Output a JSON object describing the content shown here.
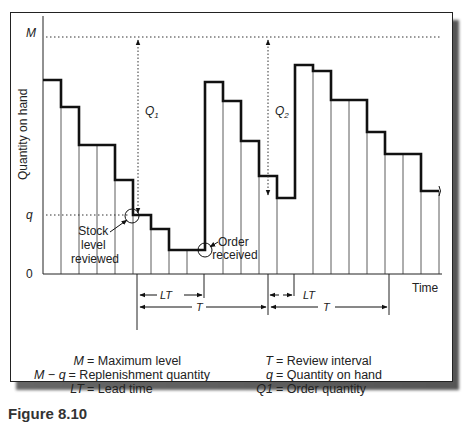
{
  "diagram": {
    "y_axis_label": "Quantity on hand",
    "x_axis_label": "Time",
    "y_ticks": {
      "max": "M",
      "reorder": "q",
      "zero": "0"
    },
    "order_labels": [
      "Q1",
      "Q2"
    ],
    "annotations": {
      "stock_reviewed": [
        "Stock",
        "level",
        "reviewed"
      ],
      "order_received": [
        "Order",
        "received"
      ]
    },
    "intervals": {
      "lead_time": "LT",
      "review_interval": "T"
    },
    "steps": [
      {
        "x0": 43,
        "x1": 61,
        "y": 80
      },
      {
        "x0": 61,
        "x1": 79,
        "y": 107
      },
      {
        "x0": 79,
        "x1": 115,
        "y": 145
      },
      {
        "x0": 115,
        "x1": 133,
        "y": 180
      },
      {
        "x0": 133,
        "x1": 151,
        "y": 215
      },
      {
        "x0": 151,
        "x1": 169,
        "y": 229
      },
      {
        "x0": 169,
        "x1": 205,
        "y": 250
      },
      {
        "x0": 205,
        "x1": 223,
        "y": 82
      },
      {
        "x0": 223,
        "x1": 241,
        "y": 101
      },
      {
        "x0": 241,
        "x1": 259,
        "y": 141
      },
      {
        "x0": 259,
        "x1": 277,
        "y": 176
      },
      {
        "x0": 277,
        "x1": 295,
        "y": 198
      },
      {
        "x0": 295,
        "x1": 313,
        "y": 65
      },
      {
        "x0": 313,
        "x1": 331,
        "y": 71
      },
      {
        "x0": 331,
        "x1": 367,
        "y": 100
      },
      {
        "x0": 367,
        "x1": 385,
        "y": 132
      },
      {
        "x0": 385,
        "x1": 421,
        "y": 154
      },
      {
        "x0": 421,
        "x1": 439,
        "y": 191
      }
    ]
  },
  "legend": {
    "left": [
      {
        "symbol": "M",
        "text": "= Maximum level"
      },
      {
        "symbol": "M − q",
        "text": "= Replenishment quantity"
      },
      {
        "symbol": "LT",
        "text": "= Lead time"
      }
    ],
    "right": [
      {
        "symbol": "T",
        "text": "= Review interval"
      },
      {
        "symbol": "q",
        "text": "= Quantity on hand"
      },
      {
        "symbol": "Q1",
        "text": "= Order quantity"
      }
    ]
  },
  "caption": "Figure 8.10"
}
